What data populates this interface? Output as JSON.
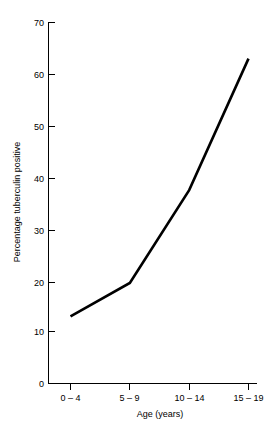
{
  "chart_data": {
    "type": "line",
    "title": "",
    "xlabel": "Age (years)",
    "ylabel": "Percentage tuberculin positive",
    "categories": [
      "0 – 4",
      "5 – 9",
      "10 – 14",
      "15 – 19"
    ],
    "values": [
      13.0,
      19.5,
      37.5,
      63.0
    ],
    "series": [
      {
        "name": "Percentage tuberculin positive",
        "values": [
          13.0,
          19.5,
          37.5,
          63.0
        ]
      }
    ],
    "ylim": [
      0,
      70
    ],
    "yticks": [
      0,
      10,
      20,
      30,
      40,
      50,
      60,
      70
    ],
    "ytick_labels": [
      "0",
      "10",
      "20",
      "30",
      "40",
      "50",
      "60",
      "70"
    ],
    "xtick_labels": [
      "0 – 4",
      "5 – 9",
      "10 – 14",
      "15 – 19"
    ],
    "grid": false,
    "legend": false,
    "legend_position": "none",
    "line_color": "#000000",
    "background_color": "#ffffff"
  },
  "axes": {
    "y_axis_title": "Percentage tuberculin positive",
    "x_axis_title": "Age (years)",
    "y_ticks": [
      {
        "label": "70",
        "value": 70
      },
      {
        "label": "60",
        "value": 60
      },
      {
        "label": "50",
        "value": 50
      },
      {
        "label": "40",
        "value": 40
      },
      {
        "label": "30",
        "value": 30
      },
      {
        "label": "20",
        "value": 20
      },
      {
        "label": "10",
        "value": 10
      },
      {
        "label": "0",
        "value": 0
      }
    ],
    "x_ticks": [
      {
        "label": "0 – 4",
        "value": 0
      },
      {
        "label": "5 – 9",
        "value": 1
      },
      {
        "label": "10 – 14",
        "value": 2
      },
      {
        "label": "15 – 19",
        "value": 3
      }
    ]
  }
}
